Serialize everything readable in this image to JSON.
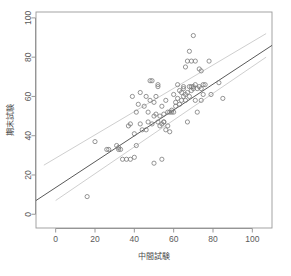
{
  "chart_data": {
    "type": "scatter",
    "title": "",
    "xlabel": "中間試験",
    "ylabel": "期末試験",
    "xlim": [
      -10,
      110
    ],
    "ylim": [
      -7,
      103
    ],
    "xticks": [
      0,
      20,
      40,
      60,
      80,
      100
    ],
    "yticks": [
      0,
      20,
      40,
      60,
      80,
      100
    ],
    "grid": false,
    "legend": null,
    "marker": "open-circle",
    "marker_color": "#7a7a7a",
    "fit_line_color": "#595959",
    "band_color": "#cfcfcf",
    "series": [
      {
        "name": "students",
        "points": [
          [
            16,
            9
          ],
          [
            20,
            37
          ],
          [
            26,
            33
          ],
          [
            27,
            33
          ],
          [
            31,
            35
          ],
          [
            32,
            34
          ],
          [
            32,
            33
          ],
          [
            33,
            33
          ],
          [
            34,
            28
          ],
          [
            36,
            28
          ],
          [
            37,
            45
          ],
          [
            38,
            28
          ],
          [
            38,
            46
          ],
          [
            39,
            60
          ],
          [
            40,
            29
          ],
          [
            40,
            41
          ],
          [
            41,
            35
          ],
          [
            41,
            52
          ],
          [
            42,
            56
          ],
          [
            43,
            46
          ],
          [
            43,
            62
          ],
          [
            44,
            43
          ],
          [
            45,
            55
          ],
          [
            46,
            43
          ],
          [
            46,
            60
          ],
          [
            47,
            47
          ],
          [
            47,
            52
          ],
          [
            48,
            58
          ],
          [
            48,
            68
          ],
          [
            49,
            46
          ],
          [
            49,
            68
          ],
          [
            50,
            26
          ],
          [
            50,
            50
          ],
          [
            50,
            57
          ],
          [
            51,
            51
          ],
          [
            51,
            60
          ],
          [
            52,
            47
          ],
          [
            52,
            65
          ],
          [
            52,
            66
          ],
          [
            53,
            50
          ],
          [
            53,
            45
          ],
          [
            54,
            28
          ],
          [
            54,
            46
          ],
          [
            54,
            55
          ],
          [
            55,
            47
          ],
          [
            55,
            47
          ],
          [
            55,
            51
          ],
          [
            56,
            43
          ],
          [
            56,
            58
          ],
          [
            57,
            45
          ],
          [
            57,
            52
          ],
          [
            58,
            42
          ],
          [
            58,
            52
          ],
          [
            59,
            52
          ],
          [
            59,
            53
          ],
          [
            60,
            52
          ],
          [
            60,
            61
          ],
          [
            61,
            55
          ],
          [
            61,
            57
          ],
          [
            62,
            59
          ],
          [
            62,
            66
          ],
          [
            63,
            56
          ],
          [
            63,
            63
          ],
          [
            64,
            58
          ],
          [
            64,
            62
          ],
          [
            65,
            60
          ],
          [
            65,
            64
          ],
          [
            65,
            65
          ],
          [
            66,
            58
          ],
          [
            66,
            61
          ],
          [
            66,
            75
          ],
          [
            67,
            47
          ],
          [
            67,
            62
          ],
          [
            67,
            78
          ],
          [
            68,
            60
          ],
          [
            68,
            65
          ],
          [
            68,
            83
          ],
          [
            69,
            63
          ],
          [
            69,
            65
          ],
          [
            69,
            78
          ],
          [
            70,
            64
          ],
          [
            70,
            65
          ],
          [
            70,
            91
          ],
          [
            71,
            58
          ],
          [
            71,
            66
          ],
          [
            71,
            78
          ],
          [
            72,
            52
          ],
          [
            72,
            64
          ],
          [
            73,
            65
          ],
          [
            73,
            74
          ],
          [
            74,
            58
          ],
          [
            74,
            64
          ],
          [
            74,
            73
          ],
          [
            75,
            61
          ],
          [
            75,
            66
          ],
          [
            76,
            66
          ],
          [
            78,
            78
          ],
          [
            79,
            61
          ],
          [
            83,
            67
          ],
          [
            85,
            59
          ]
        ]
      }
    ],
    "fit_line": {
      "name": "regression",
      "x": [
        -10,
        110
      ],
      "y": [
        7,
        86
      ]
    },
    "bands": [
      {
        "name": "upper-band",
        "x": [
          -6,
          107
        ],
        "y": [
          25,
          92
        ]
      },
      {
        "name": "lower-band",
        "x": [
          0,
          107
        ],
        "y": [
          7,
          80
        ]
      }
    ]
  },
  "caption": {
    "text": ""
  }
}
